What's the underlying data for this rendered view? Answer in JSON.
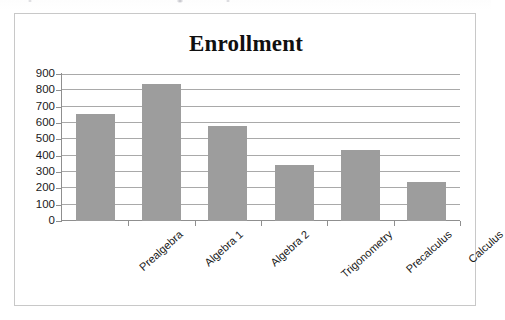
{
  "chart_data": {
    "type": "bar",
    "title": "Enrollment",
    "xlabel": "",
    "ylabel": "",
    "categories": [
      "Prealgebra",
      "Algebra 1",
      "Algebra 2",
      "Trigonometry",
      "Precalculus",
      "Calculus"
    ],
    "values": [
      655,
      840,
      580,
      340,
      435,
      240
    ],
    "series": [
      {
        "name": "Enrollment",
        "values": [
          655,
          840,
          580,
          340,
          435,
          240
        ]
      }
    ],
    "ylim": [
      0,
      900
    ],
    "ytick_step": 100,
    "ytick_labels": [
      "900",
      "800",
      "700",
      "600",
      "500",
      "400",
      "300",
      "200",
      "100",
      "0"
    ],
    "grid": true,
    "legend": false,
    "legend_position": "none",
    "bar_color": "#9d9d9d",
    "gridline_color": "#a9a9a9",
    "axis_color": "#8f8f8f",
    "title_color": "#101010",
    "frame_border_color": "#c8c8c8",
    "background_color": "#ffffff"
  }
}
